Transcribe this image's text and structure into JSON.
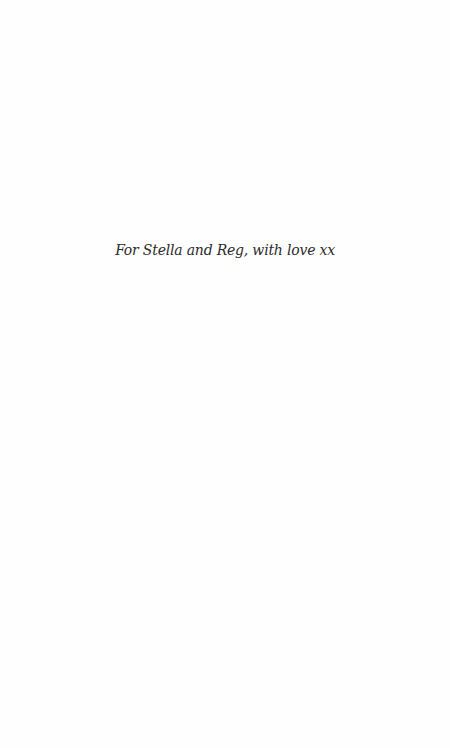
{
  "page": {
    "dedication": "For Stella and Reg, with love xx"
  }
}
